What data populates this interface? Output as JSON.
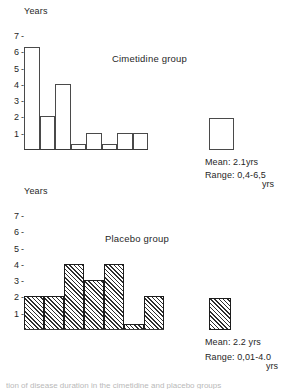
{
  "figure": {
    "axis_label": "Years",
    "truncated_caption": "tion of disease duration in the cimetidine and placebo groups"
  },
  "chart_data": [
    {
      "type": "bar",
      "title": "Cimetidine group",
      "xlabel": "",
      "ylabel": "Years",
      "ylim": [
        0,
        7.5
      ],
      "yticks": [
        1,
        2,
        3,
        4,
        5,
        6,
        7
      ],
      "grid": false,
      "legend": "none",
      "fill": "open",
      "categories": [
        "1",
        "2",
        "3",
        "4",
        "5",
        "6",
        "7",
        "8"
      ],
      "values": [
        6.3,
        2.0,
        4.0,
        0.3,
        1.0,
        0.3,
        1.0,
        1.0
      ],
      "annotations": {
        "mean_label": "Mean: 2.1yrs",
        "range_label": "Range: 0,4-6,5",
        "unit_label": "yrs",
        "summary_bar_value": 2.1
      }
    },
    {
      "type": "bar",
      "title": "Placebo group",
      "xlabel": "",
      "ylabel": "Years",
      "ylim": [
        0,
        7.5
      ],
      "yticks": [
        1,
        2,
        3,
        4,
        5,
        6,
        7
      ],
      "grid": false,
      "legend": "none",
      "fill": "hatched",
      "categories": [
        "1",
        "2",
        "3",
        "4",
        "5",
        "6",
        "7"
      ],
      "values": [
        2.0,
        2.0,
        4.0,
        3.0,
        4.0,
        0.3,
        2.0
      ],
      "annotations": {
        "mean_label": "Mean: 2.2 yrs",
        "range_label": "Range: 0,01-4.0",
        "unit_label": "yrs",
        "summary_bar_value": 2.2
      }
    }
  ]
}
